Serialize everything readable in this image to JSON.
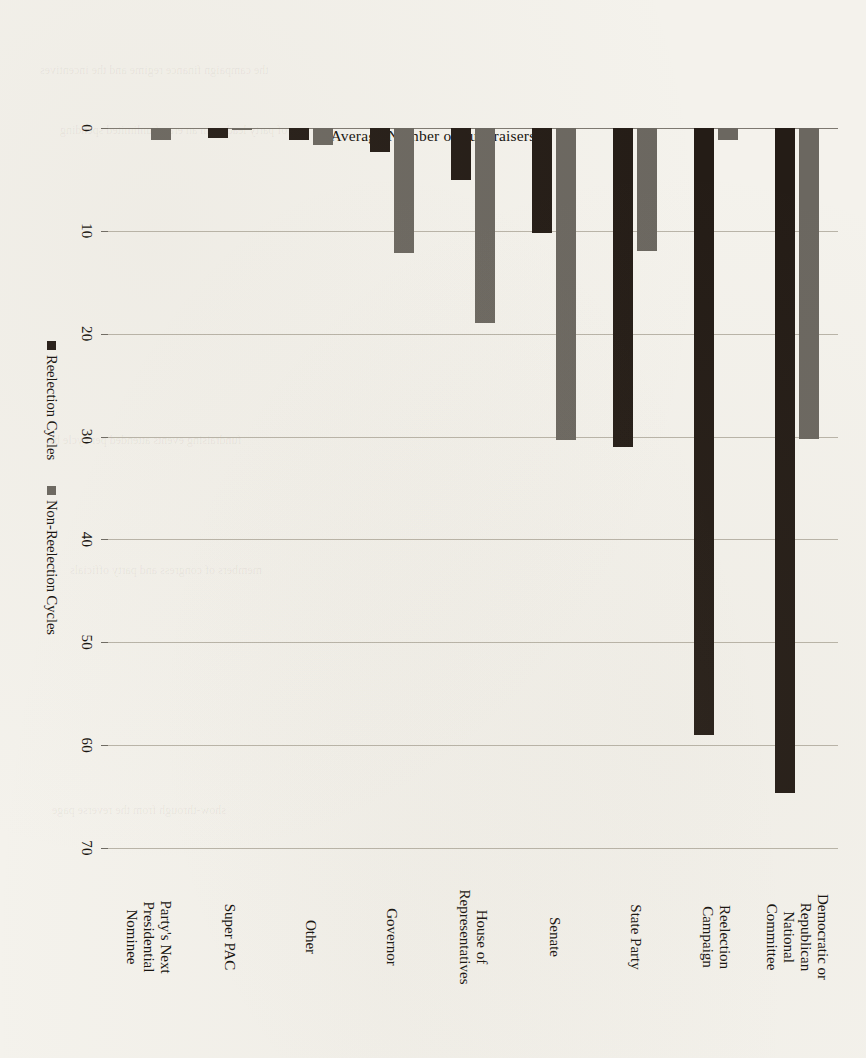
{
  "chart_data": {
    "type": "bar",
    "orientation": "horizontal",
    "title": "",
    "xlabel": "",
    "ylabel": "Average Number of Fundraisers",
    "ylim": [
      0,
      70
    ],
    "yticks": [
      "0",
      "10",
      "20",
      "30",
      "40",
      "50",
      "60",
      "70"
    ],
    "grid": true,
    "legend_position": "bottom",
    "categories": [
      "Democratic or Republican National Committee",
      "Reelection Campaign",
      "State Party",
      "Senate",
      "House of Representatives",
      "Governor",
      "Other",
      "Super PAC",
      "Party's Next Presidential Nominee"
    ],
    "category_labels": [
      [
        "Democratic or",
        "Republican",
        "National",
        "Committee"
      ],
      [
        "Reelection",
        "Campaign"
      ],
      [
        "State Party"
      ],
      [
        "Senate"
      ],
      [
        "House of",
        "Representatives"
      ],
      [
        "Governor"
      ],
      [
        "Other"
      ],
      [
        "Super PAC"
      ],
      [
        "Party's Next",
        "Presidential",
        "Nominee"
      ]
    ],
    "series": [
      {
        "name": "Reelection Cycles",
        "color": "#241c16",
        "values": [
          64.7,
          59.0,
          31.0,
          10.2,
          5.1,
          2.3,
          1.2,
          1.0,
          0.0
        ]
      },
      {
        "name": "Non-Reelection Cycles",
        "color": "#6b6760",
        "values": [
          30.2,
          1.2,
          12.0,
          30.3,
          19.0,
          12.2,
          1.7,
          0.2,
          1.2
        ]
      }
    ]
  },
  "legend": {
    "items": [
      {
        "label": "Reelection Cycles",
        "swatch": "reelection"
      },
      {
        "label": "Non-Reelection Cycles",
        "swatch": "nonreelection"
      }
    ]
  },
  "colors": {
    "reelection": "#241c16",
    "nonreelection": "#6b6760",
    "paper": "#f4f2ec",
    "grid": "#b9b4a8",
    "text": "#14110d"
  },
  "ghost_text": [
    "the campaign finance regime and the incentives",
    "of party leaders in an era of unlimited spending",
    "fundraising events attended per cycle by",
    "members of congress and party officials",
    "show-through from the reverse page"
  ]
}
